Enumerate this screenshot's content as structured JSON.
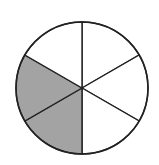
{
  "diagram": {
    "type": "fraction-circle",
    "sectors_total": 6,
    "sectors_shaded": 2,
    "fraction_shaded": "2/6",
    "center": [
      82,
      88
    ],
    "radius": 66,
    "shaded_sector_indices": [
      3,
      4
    ],
    "colors": {
      "shaded": "#a3a3a3",
      "unshaded": "#ffffff",
      "stroke": "#222222"
    }
  }
}
